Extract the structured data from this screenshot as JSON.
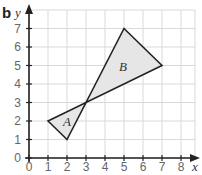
{
  "part_label": "b",
  "axes": {
    "x_name": "x",
    "y_name": "y",
    "x_ticks": [
      "0",
      "1",
      "2",
      "3",
      "4",
      "5",
      "6",
      "7",
      "8"
    ],
    "y_ticks": [
      "0",
      "1",
      "2",
      "3",
      "4",
      "5",
      "6",
      "7"
    ]
  },
  "shapes": [
    {
      "label": "A",
      "vertices": [
        [
          1,
          2
        ],
        [
          2,
          1
        ],
        [
          3,
          3
        ]
      ],
      "fill": "#e6e6e6"
    },
    {
      "label": "B",
      "vertices": [
        [
          3,
          3
        ],
        [
          5,
          7
        ],
        [
          7,
          5
        ]
      ],
      "fill": "#e6e6e6"
    }
  ],
  "colors": {
    "grid": "#d9d9d9",
    "axis": "#222222",
    "outline": "#222222"
  }
}
